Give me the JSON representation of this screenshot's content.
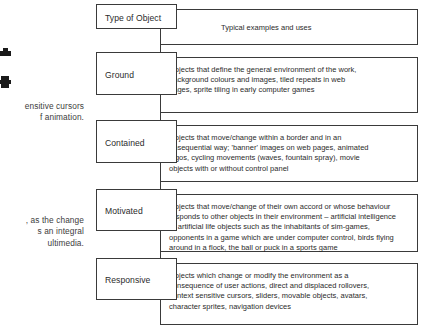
{
  "page": {
    "kind": "scanned-book-page-table",
    "left_bleed": {
      "glyph_1_name": "ink-blob-glyph-upper",
      "glyph_2_name": "ink-blob-glyph-lower",
      "paragraph_1": "ensitive cursors\nf animation.",
      "paragraph_2": ", as the change\ns an integral\nultimedia."
    }
  },
  "table": {
    "header": {
      "type_label": "Type of Object",
      "description_label": "Typical examples and uses"
    },
    "rows": [
      {
        "type": "Ground",
        "description": "Objects that define the general environment of the work,\nbackground colours and images, tiled repeats in web\npages, sprite tiling in early computer games"
      },
      {
        "type": "Contained",
        "description": "Objects that move/change within a border and in an\nunsequential way; 'banner' images on web pages, animated\nlogos, cycling movements (waves, fountain spray), movie\nobjects with or without control panel"
      },
      {
        "type": "Motivated",
        "description": "Objects that move/change of their own accord or whose behaviour\nresponds to other objects in their environment – artificial intelligence\nor artificial life objects such as the inhabitants of sim-games,\nopponents in a game which are under computer control, birds flying\naround in a flock, the ball or puck in a sports game"
      },
      {
        "type": "Responsive",
        "description": "Objects which change or modify the environment as a\nconsequence of user actions, direct and displaced rollovers,\ncontext sensitive cursors, sliders, movable objects, avatars,\ncharacter sprites, navigation devices"
      }
    ]
  },
  "colors": {
    "page_background": "#ffffff",
    "border": "#3a3a3a",
    "text": "#2b2b2b"
  }
}
